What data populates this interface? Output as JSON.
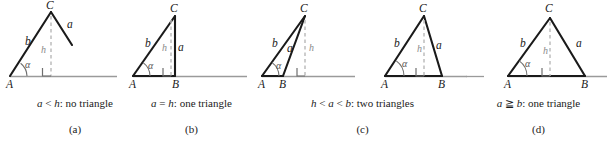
{
  "figure": {
    "colors": {
      "stroke_solid": "#1a1a1a",
      "stroke_baseline_ray": "#9a9a9a",
      "stroke_dashed_height": "#b5b5b5",
      "stroke_right_angle": "#6f6f6f",
      "stroke_angle_arc": "#6f6f6f",
      "text": "#1a1a1a",
      "text_muted": "#8a8a8a",
      "background": "#ffffff"
    },
    "panels": [
      {
        "id": "panel-a",
        "letter": "(a)",
        "condition_parts": [
          {
            "text": "a",
            "italic": true
          },
          {
            "text": " < ",
            "italic": false
          },
          {
            "text": "h",
            "italic": true
          },
          {
            "text": ": no triangle",
            "italic": false
          }
        ],
        "condition_text": "a < h: no triangle",
        "labels": {
          "vertex_A": "A",
          "vertex_B": "",
          "vertex_C": "C",
          "side_a": "a",
          "side_b": "b",
          "height_h": "h",
          "angle_alpha": "α"
        }
      },
      {
        "id": "panel-b",
        "letter": "(b)",
        "condition_parts": [
          {
            "text": "a",
            "italic": true
          },
          {
            "text": " = ",
            "italic": false
          },
          {
            "text": "h",
            "italic": true
          },
          {
            "text": ": one triangle",
            "italic": false
          }
        ],
        "condition_text": "a = h: one triangle",
        "labels": {
          "vertex_A": "A",
          "vertex_B": "B",
          "vertex_C": "C",
          "side_a": "a",
          "side_b": "b",
          "height_h": "h",
          "angle_alpha": "α"
        }
      },
      {
        "id": "panel-c",
        "letter": "(c)",
        "condition_parts": [
          {
            "text": "h",
            "italic": true
          },
          {
            "text": " < ",
            "italic": false
          },
          {
            "text": "a",
            "italic": true
          },
          {
            "text": " < ",
            "italic": false
          },
          {
            "text": "b",
            "italic": true
          },
          {
            "text": ": two triangles",
            "italic": false
          }
        ],
        "condition_text": "h < a < b: two triangles",
        "labels": {
          "vertex_A": "A",
          "vertex_B": "B",
          "vertex_C": "C",
          "side_a": "a",
          "side_b": "b",
          "height_h": "h",
          "angle_alpha": "α"
        },
        "labels_second": {
          "vertex_A": "A",
          "vertex_B": "B",
          "vertex_C": "C",
          "side_a": "a",
          "side_b": "b",
          "height_h": "h",
          "angle_alpha": "α"
        }
      },
      {
        "id": "panel-d",
        "letter": "(d)",
        "condition_parts": [
          {
            "text": "a",
            "italic": true
          },
          {
            "text": " ≧ ",
            "italic": false
          },
          {
            "text": "b",
            "italic": true
          },
          {
            "text": ": one triangle",
            "italic": false
          }
        ],
        "condition_text": "a ≧ b: one triangle",
        "labels": {
          "vertex_A": "A",
          "vertex_B": "B",
          "vertex_C": "C",
          "side_a": "a",
          "side_b": "b",
          "height_h": "h",
          "angle_alpha": "α"
        }
      }
    ]
  }
}
